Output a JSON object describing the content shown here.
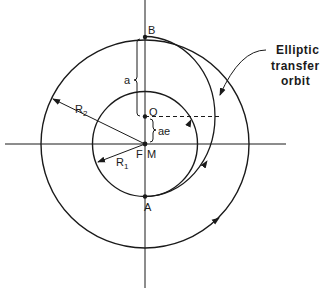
{
  "diagram": {
    "labels": {
      "apogee": "B",
      "perigee": "A",
      "ellipse_center": "O",
      "focus": "F",
      "body_center": "M",
      "semi_major_axis": "a",
      "focus_offset": "ae",
      "inner_radius": "R",
      "inner_radius_sub": "1",
      "outer_radius": "R",
      "outer_radius_sub": "2"
    },
    "callout": {
      "line1": "Elliptic",
      "line2": "transfer",
      "line3": "orbit"
    },
    "colors": {
      "ink": "#1a1a1a",
      "background": "#ffffff"
    }
  }
}
